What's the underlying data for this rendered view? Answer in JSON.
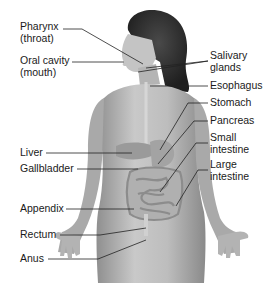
{
  "diagram": {
    "line_color": "#222222",
    "text_color": "#1a1a1a",
    "skin_tone": "#b8b8b8",
    "hair_tone": "#2a2a2a",
    "labels_left": [
      {
        "id": "pharynx",
        "text": "Pharynx\n(throat)"
      },
      {
        "id": "oral-cavity",
        "text": "Oral cavity\n(mouth)"
      },
      {
        "id": "liver",
        "text": "Liver"
      },
      {
        "id": "gallbladder",
        "text": "Gallbladder"
      },
      {
        "id": "appendix",
        "text": "Appendix"
      },
      {
        "id": "rectum",
        "text": "Rectum"
      },
      {
        "id": "anus",
        "text": "Anus"
      }
    ],
    "labels_right": [
      {
        "id": "salivary-glands",
        "text": "Salivary\nglands"
      },
      {
        "id": "esophagus",
        "text": "Esophagus"
      },
      {
        "id": "stomach",
        "text": "Stomach"
      },
      {
        "id": "pancreas",
        "text": "Pancreas"
      },
      {
        "id": "small-intestine",
        "text": "Small\nintestine"
      },
      {
        "id": "large-intestine",
        "text": "Large\nintestine"
      }
    ]
  }
}
